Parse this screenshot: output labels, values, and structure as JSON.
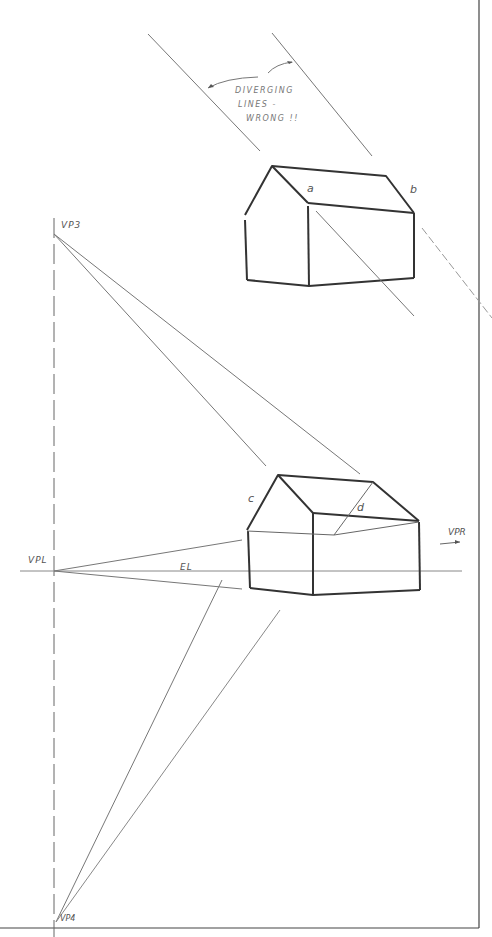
{
  "diagram": {
    "type": "two-point and three-point perspective sketch",
    "annotation": {
      "line1": "DIVERGING",
      "line2": "LINES -",
      "line3": "WRONG !!"
    },
    "labels": {
      "a": "a",
      "b": "b",
      "c": "c",
      "d": "d",
      "vp3": "VP3",
      "vpl": "VPL",
      "vpr": "VPR",
      "vp4": "VP4",
      "el": "EL"
    },
    "colors": {
      "ink": "#333333",
      "thin_line": "#888888",
      "border": "#444444"
    }
  }
}
